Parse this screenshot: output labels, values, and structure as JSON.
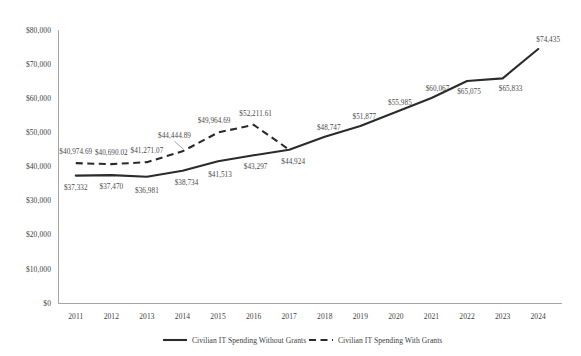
{
  "chart_data": {
    "type": "line",
    "title": "",
    "xlabel": "",
    "ylabel": "",
    "ylim": [
      0,
      80000
    ],
    "grid": false,
    "legend_position": "bottom",
    "categories": [
      "2011",
      "2012",
      "2013",
      "2014",
      "2015",
      "2016",
      "2017",
      "2018",
      "2019",
      "2020",
      "2021",
      "2022",
      "2023",
      "2024"
    ],
    "ytick_labels": [
      "$80,000",
      "$70,000",
      "$60,000",
      "$50,000",
      "$40,000",
      "$30,000",
      "$20,000",
      "$10,000",
      "$0"
    ],
    "ytick_values": [
      80000,
      70000,
      60000,
      50000,
      40000,
      30000,
      20000,
      10000,
      0
    ],
    "series": [
      {
        "name": "Civilian IT Spending Without Grants",
        "style": "solid",
        "color": "#2b2b2b",
        "x": [
          "2011",
          "2012",
          "2013",
          "2014",
          "2015",
          "2016",
          "2017",
          "2018",
          "2019",
          "2020",
          "2021",
          "2022",
          "2023",
          "2024"
        ],
        "values": [
          37332,
          37470,
          36981,
          38734,
          41513,
          43297,
          44924,
          48747,
          51877,
          55985,
          60067,
          65075,
          65833,
          74435
        ],
        "labels": [
          "$37,332",
          "$37,470",
          "$36,981",
          "$38,734",
          "$41,513",
          "$43,297",
          "$44,924",
          "$48,747",
          "$51,877",
          "$55,985",
          "$60,067",
          "$65,075",
          "$65,833",
          "$74,435"
        ]
      },
      {
        "name": "Civilian IT Spending With Grants",
        "style": "dashed",
        "color": "#2b2b2b",
        "x": [
          "2011",
          "2012",
          "2013",
          "2014",
          "2015",
          "2016",
          "2017"
        ],
        "values": [
          40974.69,
          40690.02,
          41271.07,
          44444.89,
          49964.69,
          52211.61,
          44924
        ],
        "labels": [
          "$40,974.69",
          "$40,690.02",
          "$41,271.07",
          "$44,444.89",
          "$49,964.69",
          "$52,211.61",
          ""
        ]
      }
    ],
    "legend": [
      {
        "label": "Civilian IT Spending Without Grants",
        "style": "solid"
      },
      {
        "label": "Civilian IT Spending With Grants",
        "style": "dashed"
      }
    ]
  }
}
